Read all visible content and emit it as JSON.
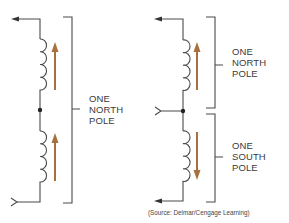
{
  "diagram": {
    "colors": {
      "wire": "#4a4a4a",
      "arrow": "#a8703c",
      "text": "#3a3a3a"
    },
    "left_circuit": {
      "label": {
        "lines": [
          "ONE",
          "NORTH",
          "POLE"
        ]
      },
      "coils": [
        {
          "name": "upper-coil",
          "arrow_direction": "up"
        },
        {
          "name": "lower-coil",
          "arrow_direction": "up"
        }
      ]
    },
    "right_circuit": {
      "upper_label": {
        "lines": [
          "ONE",
          "NORTH",
          "POLE"
        ]
      },
      "lower_label": {
        "lines": [
          "ONE",
          "SOUTH",
          "POLE"
        ]
      },
      "coils": [
        {
          "name": "upper-coil",
          "arrow_direction": "up"
        },
        {
          "name": "lower-coil",
          "arrow_direction": "down"
        }
      ]
    },
    "source_credit": "(Source: Delmar/Cengage Learning)"
  }
}
